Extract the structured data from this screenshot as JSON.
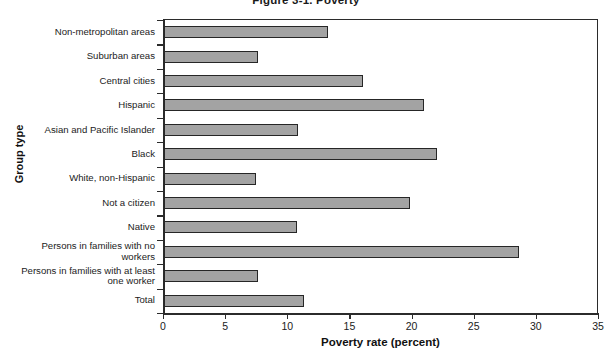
{
  "chart_data": {
    "type": "bar",
    "orientation": "horizontal",
    "title": "Figure 3-1. Poverty",
    "xlabel": "Poverty rate (percent)",
    "ylabel": "Group type",
    "xlim": [
      0,
      35
    ],
    "xticks": [
      0,
      5,
      10,
      15,
      20,
      25,
      30,
      35
    ],
    "grid": false,
    "legend": null,
    "bar_color": "#a3a3a3",
    "bar_edge_color": "#262626",
    "categories": [
      "Non-metropolitan areas",
      "Suburban areas",
      "Central cities",
      "Hispanic",
      "Asian and Pacific Islander",
      "Black",
      "White, non-Hispanic",
      "Not a citizen",
      "Native",
      "Persons in families with no workers",
      "Persons in families with at least one worker",
      "Total"
    ],
    "category_lines": [
      [
        "Non-metropolitan areas"
      ],
      [
        "Suburban areas"
      ],
      [
        "Central cities"
      ],
      [
        "Hispanic"
      ],
      [
        "Asian and Pacific Islander"
      ],
      [
        "Black"
      ],
      [
        "White, non-Hispanic"
      ],
      [
        "Not a citizen"
      ],
      [
        "Native"
      ],
      [
        "Persons in families with no",
        "workers"
      ],
      [
        "Persons in families with at least",
        "one worker"
      ],
      [
        "Total"
      ]
    ],
    "values": [
      13.2,
      7.6,
      16.0,
      20.9,
      10.8,
      22.0,
      7.4,
      19.8,
      10.7,
      28.6,
      7.6,
      11.3
    ]
  }
}
